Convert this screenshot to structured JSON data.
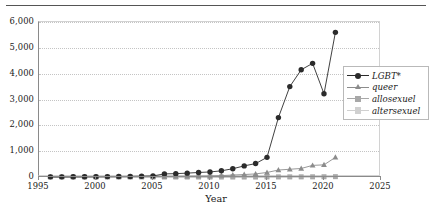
{
  "chart_data": {
    "type": "line",
    "title": "",
    "xlabel": "Year",
    "ylabel": "",
    "xlim": [
      1995,
      2025
    ],
    "ylim": [
      0,
      6000
    ],
    "grid": true,
    "legend_position": "right",
    "xticks": [
      1995,
      2000,
      2005,
      2010,
      2015,
      2020,
      2025
    ],
    "yticks": [
      0,
      1000,
      2000,
      3000,
      4000,
      5000,
      6000
    ],
    "ytick_labels": [
      "0",
      "1,000",
      "2,000",
      "3,000",
      "4,000",
      "5,000",
      "6,000"
    ],
    "x": [
      1996,
      1997,
      1998,
      1999,
      2000,
      2001,
      2002,
      2003,
      2004,
      2005,
      2006,
      2007,
      2008,
      2009,
      2010,
      2011,
      2012,
      2013,
      2014,
      2015,
      2016,
      2017,
      2018,
      2019,
      2020,
      2021
    ],
    "series": [
      {
        "name": "LGBT*",
        "marker": "circle",
        "color": "#2b2b2b",
        "values": [
          5,
          6,
          8,
          10,
          12,
          15,
          18,
          22,
          30,
          40,
          120,
          130,
          150,
          175,
          195,
          240,
          320,
          430,
          520,
          760,
          2300,
          3500,
          4150,
          4400,
          3220,
          5600
        ]
      },
      {
        "name": "queer",
        "marker": "triangle",
        "color": "#8c8c8c",
        "values": [
          3,
          3,
          4,
          5,
          6,
          7,
          8,
          10,
          12,
          15,
          20,
          24,
          28,
          34,
          40,
          55,
          75,
          95,
          120,
          175,
          270,
          300,
          330,
          450,
          470,
          760
        ]
      },
      {
        "name": "allosexuel",
        "marker": "square",
        "color": "#a8a8a8",
        "values": [
          0,
          0,
          0,
          0,
          0,
          0,
          0,
          0,
          0,
          0,
          0,
          0,
          0,
          0,
          0,
          0,
          0,
          0,
          0,
          2,
          4,
          5,
          6,
          8,
          10,
          14
        ]
      },
      {
        "name": "altersexuel",
        "marker": "square",
        "color": "#d0d0d0",
        "values": [
          0,
          0,
          0,
          0,
          0,
          0,
          0,
          0,
          0,
          0,
          0,
          0,
          0,
          0,
          0,
          0,
          0,
          0,
          0,
          1,
          2,
          2,
          3,
          4,
          5,
          7
        ]
      }
    ]
  }
}
